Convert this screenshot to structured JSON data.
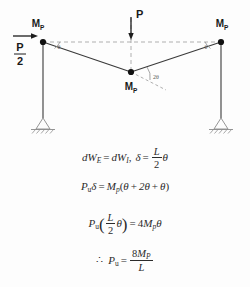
{
  "figure": {
    "title_alt": "plastic collapse mechanism of portal frame",
    "loads": {
      "vertical_load_label": "P",
      "horizontal_load_numerator": "P",
      "horizontal_load_denominator": "2"
    },
    "hinges": [
      {
        "id": "left-top",
        "label_main": "M",
        "label_sub": "P"
      },
      {
        "id": "apex",
        "label_main": "M",
        "label_sub": "P"
      },
      {
        "id": "right-top",
        "label_main": "M",
        "label_sub": "P"
      }
    ],
    "angles": [
      {
        "id": "left-rotation",
        "label": "θ"
      },
      {
        "id": "apex-rotation",
        "label": "2θ"
      },
      {
        "id": "right-rotation",
        "label": "θ"
      }
    ],
    "colors": {
      "member": "#3a3a3a",
      "dashed": "#9a9a9a",
      "hinge": "#111111",
      "support": "#8a8a8a",
      "background": "#fdfdfd"
    }
  },
  "equations": {
    "line1": {
      "lhs_d": "d",
      "lhs_w": "W",
      "lhs_sub": "E",
      "eq": "=",
      "rhs_d": "d",
      "rhs_w": "W",
      "rhs_sub": "I",
      "comma": ",",
      "delta": "δ",
      "eq2": "=",
      "frac_num": "L",
      "frac_den": "2",
      "theta": "θ"
    },
    "line2": {
      "p": "P",
      "p_sub": "u",
      "delta": "δ",
      "eq": "=",
      "m": "M",
      "m_sub": "p",
      "open": "(",
      "term1": "θ",
      "plus1": "+",
      "term2": "2θ",
      "plus2": "+",
      "term3": "θ",
      "close": ")"
    },
    "line3": {
      "p": "P",
      "p_sub": "u",
      "open": "(",
      "frac_num": "L",
      "frac_den": "2",
      "theta": "θ",
      "close": ")",
      "eq": "=",
      "coeff": "4",
      "m": "M",
      "m_sub": "p",
      "theta2": "θ"
    },
    "line4": {
      "therefore": "∴",
      "p": "P",
      "p_sub": "u",
      "eq": "=",
      "frac_num_coeff": "8",
      "frac_num_m": "M",
      "frac_num_sub": "P",
      "frac_den": "L"
    }
  }
}
